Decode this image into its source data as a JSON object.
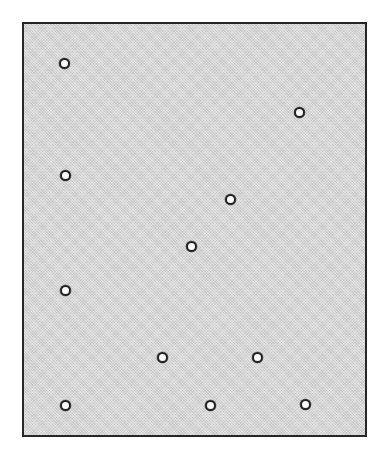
{
  "figure": {
    "title": "",
    "subtitle": "",
    "background_color": "#ffffff"
  },
  "plot_area": {
    "name": "scatter-plot-panel",
    "fill_color": "#d3d3d3",
    "border_color": "#262626",
    "border_width_px": 2,
    "x_px": 22,
    "y_px": 22,
    "width_px": 345,
    "height_px": 415
  },
  "marker_style": {
    "shape": "circle",
    "fill_color": "#fdfdfd",
    "edge_color": "#242424",
    "diameter_px": 11,
    "edge_width_px": 2
  },
  "chart_data": {
    "type": "scatter",
    "title": "",
    "subtitle": "",
    "xlabel": "",
    "ylabel": "",
    "xlim": [
      0,
      100
    ],
    "ylim": [
      0,
      100
    ],
    "grid": false,
    "legend": null,
    "legend_position": "none",
    "xticks": [],
    "yticks": [],
    "xticklabels": [],
    "yticklabels": [],
    "annotations": [],
    "n_points": 11,
    "series": [
      {
        "name": "points",
        "marker": "o",
        "color": "#fdfdfd",
        "edge_color": "#242424",
        "points": [
          {
            "id": "p1",
            "x": 11.7,
            "y": 90.6,
            "px_x": 62,
            "px_y": 61
          },
          {
            "id": "p2",
            "x": 80.1,
            "y": 78.8,
            "px_x": 297,
            "px_y": 110
          },
          {
            "id": "p3",
            "x": 11.9,
            "y": 63.4,
            "px_x": 63,
            "px_y": 173
          },
          {
            "id": "p4",
            "x": 60.2,
            "y": 57.8,
            "px_x": 228,
            "px_y": 197
          },
          {
            "id": "p5",
            "x": 48.8,
            "y": 46.4,
            "px_x": 189,
            "px_y": 244
          },
          {
            "id": "p6",
            "x": 12.1,
            "y": 35.8,
            "px_x": 63,
            "px_y": 288
          },
          {
            "id": "p7",
            "x": 40.4,
            "y": 19.6,
            "px_x": 160,
            "px_y": 355
          },
          {
            "id": "p8",
            "x": 68.0,
            "y": 19.6,
            "px_x": 255,
            "px_y": 355
          },
          {
            "id": "p9",
            "x": 12.1,
            "y": 8.1,
            "px_x": 63,
            "px_y": 403
          },
          {
            "id": "p10",
            "x": 54.1,
            "y": 8.2,
            "px_x": 208,
            "px_y": 403
          },
          {
            "id": "p11",
            "x": 81.7,
            "y": 8.4,
            "px_x": 303,
            "px_y": 402
          }
        ]
      }
    ]
  }
}
